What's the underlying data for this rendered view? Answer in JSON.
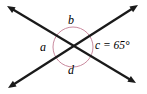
{
  "figure": {
    "name": "intersecting-lines-angle-diagram",
    "background_color": "#ffffff"
  },
  "lines": [
    {
      "id": "line-1",
      "name": "line-top-left-to-bottom-right",
      "from": {
        "x": 7,
        "y": 6
      },
      "to": {
        "x": 136,
        "y": 83
      },
      "color": "#1a1a1a",
      "width": 2.3,
      "arrow_start": true,
      "arrow_end": true
    },
    {
      "id": "line-2",
      "name": "line-bottom-left-to-top-right",
      "from": {
        "x": 8,
        "y": 88
      },
      "to": {
        "x": 138,
        "y": 5
      },
      "color": "#1a1a1a",
      "width": 2.3,
      "arrow_start": true,
      "arrow_end": true
    }
  ],
  "vertex": {
    "x": 73,
    "y": 47
  },
  "circle": {
    "name": "angle-circle",
    "cx": 73,
    "cy": 47,
    "r": 20,
    "stroke": "#c98a9e",
    "stroke_width": 1,
    "fill": "none"
  },
  "labels": {
    "a": "a",
    "b": "b",
    "c": "c = 65°",
    "d": "d"
  },
  "angles": {
    "a": {
      "symbol": "a",
      "position": "left",
      "value": null,
      "unit": "degrees"
    },
    "b": {
      "symbol": "b",
      "position": "top",
      "value": null,
      "unit": "degrees"
    },
    "c": {
      "symbol": "c",
      "position": "right",
      "value": 65,
      "unit": "degrees",
      "display": "c = 65°"
    },
    "d": {
      "symbol": "d",
      "position": "bottom",
      "value": null,
      "unit": "degrees"
    }
  },
  "colors": {
    "line": "#1a1a1a",
    "circle": "#c98a9e",
    "text": "#000000",
    "background": "#ffffff"
  }
}
